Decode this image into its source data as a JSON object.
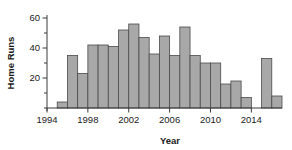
{
  "chart_data": {
    "type": "bar",
    "title": "",
    "xlabel": "Year",
    "ylabel": "Home Runs",
    "categories": [
      1995,
      1996,
      1997,
      1998,
      1999,
      2000,
      2001,
      2002,
      2003,
      2004,
      2005,
      2006,
      2007,
      2008,
      2009,
      2010,
      2011,
      2012,
      2013,
      2014,
      2015,
      2016
    ],
    "values": [
      4,
      35,
      23,
      42,
      42,
      41,
      52,
      56,
      47,
      36,
      48,
      35,
      54,
      35,
      30,
      30,
      16,
      18,
      7,
      0,
      33,
      8
    ],
    "x": [
      1995,
      1996,
      1997,
      1998,
      1999,
      2000,
      2001,
      2002,
      2003,
      2004,
      2005,
      2006,
      2007,
      2008,
      2009,
      2010,
      2011,
      2012,
      2013,
      2014,
      2015,
      2016
    ],
    "xlim": [
      1994,
      2017
    ],
    "ylim": [
      0,
      62
    ],
    "xticks": [
      1994,
      1998,
      2002,
      2006,
      2010,
      2014
    ],
    "xticklabels": [
      "1994",
      "1998",
      "2002",
      "2006",
      "2010",
      "2014"
    ],
    "yticks": [
      0,
      10,
      20,
      30,
      40,
      50,
      60
    ],
    "yticklabels": [
      "",
      "",
      "20",
      "",
      "40",
      "",
      "60"
    ],
    "ytick_major": [
      20,
      40,
      60
    ],
    "grid": false,
    "legend": null,
    "bar_color": "#a8a8a8",
    "bar_edge_color": "#4a4a4a",
    "axis_color": "#3a3a3a",
    "bar_width_years": 1
  },
  "axes": {
    "y_label": "Home Runs",
    "x_label": "Year"
  }
}
